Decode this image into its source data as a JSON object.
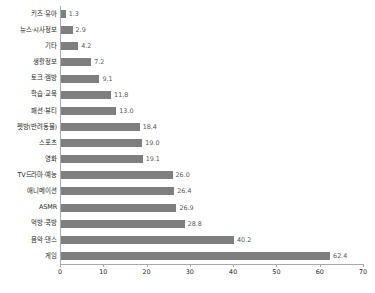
{
  "chart_data": {
    "type": "bar",
    "orientation": "horizontal",
    "title": "",
    "subtitle": "",
    "xlabel": "",
    "ylabel": "",
    "xlim": [
      0,
      70
    ],
    "xticks": [
      "0",
      "10",
      "20",
      "30",
      "40",
      "50",
      "60",
      "70"
    ],
    "grid": false,
    "legend": null,
    "bar_color": "#7f7f7f",
    "axis_color": "#a7a9ac",
    "label_color": "#231f20",
    "value_color": "#58595b",
    "categories": [
      "키즈·유아",
      "뉴스·시사정보",
      "기타",
      "생활정보",
      "토크·캠방",
      "학습·교육",
      "패션·뷰티",
      "펫방(반려동물)",
      "스포츠",
      "영화",
      "TV드라마·예능",
      "애니메이션",
      "ASMR",
      "먹방·쿡방",
      "음악·댄스",
      "게임"
    ],
    "values": [
      1.3,
      2.9,
      4.2,
      7.2,
      9.1,
      11.8,
      13.0,
      18.4,
      19.0,
      19.1,
      26.0,
      26.4,
      26.9,
      28.8,
      40.2,
      62.4
    ],
    "value_labels": [
      "1.3",
      "2.9",
      "4.2",
      "7.2",
      "9.1",
      "11.8",
      "13.0",
      "18.4",
      "19.0",
      "19.1",
      "26.0",
      "26.4",
      "26.9",
      "28.8",
      "40.2",
      "62.4"
    ]
  }
}
